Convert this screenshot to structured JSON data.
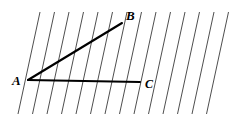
{
  "figure": {
    "background_color": "#ffffff",
    "width": 244,
    "height": 128,
    "labels": {
      "a": "A",
      "b": "B",
      "c": "C"
    },
    "label_positions": {
      "a": {
        "x": 12,
        "y": 85
      },
      "b": {
        "x": 126,
        "y": 20
      },
      "c": {
        "x": 145,
        "y": 88
      }
    },
    "points": {
      "A": {
        "x": 28,
        "y": 80
      },
      "B": {
        "x": 122,
        "y": 23
      },
      "C": {
        "x": 140,
        "y": 82
      }
    },
    "segments": [
      {
        "name": "segment-ab",
        "from": "A",
        "to": "B",
        "color": "#000000",
        "width": 2.1
      },
      {
        "name": "segment-ac",
        "from": "A",
        "to": "C",
        "color": "#000000",
        "width": 2.1
      }
    ],
    "hatching": {
      "description": "parallel slanted lines rising to the right",
      "color": "#3a3a3a",
      "stroke_width": 0.9,
      "count": 14,
      "spacing_x": 14.5,
      "first_bottom_x": 18,
      "top_y": 12,
      "bottom_y": 114,
      "dx_over_height": 22
    }
  }
}
